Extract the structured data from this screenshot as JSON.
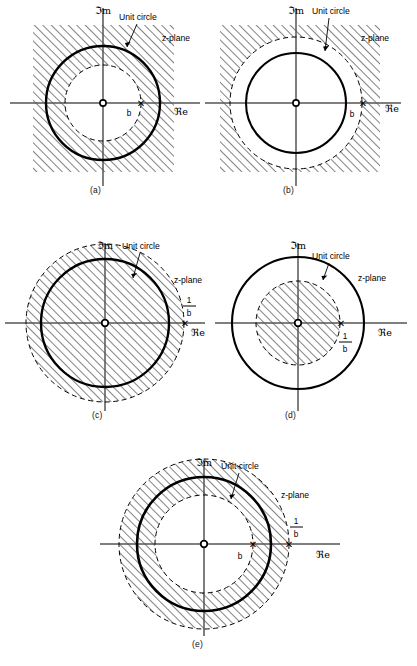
{
  "figure": {
    "panel_count": 5,
    "axis_labels": {
      "imaginary": "ℑm",
      "real": "ℜe"
    },
    "common_labels": {
      "unit_circle": "Unit circle",
      "z_plane": "z-plane",
      "pole_marker": "✕",
      "origin_marker": "o",
      "b_label": "b",
      "one_over_b_numerator": "1",
      "one_over_b_denominator": "b"
    },
    "colors": {
      "ink": "#000000",
      "background": "#ffffff",
      "hatch": "#1a1a1a",
      "axis": "#4a4a4a"
    },
    "panels": [
      {
        "id": "a",
        "caption": "(a)",
        "unit_circle_style": "solid",
        "roc_description": "hatched square region outside dashed circle of radius b",
        "circles": [
          {
            "name": "pole-circle-b",
            "radius_label": "b",
            "style": "dashed",
            "relative_radius": 0.62
          },
          {
            "name": "unit-circle",
            "radius_label": "1",
            "style": "solid-bold",
            "relative_radius": 1.0
          }
        ],
        "poles": [
          {
            "label": "b",
            "position": "inside-unit-circle"
          }
        ],
        "labels": {
          "unit_circle": "Unit circle",
          "z_plane": "z-plane",
          "pole": "b"
        }
      },
      {
        "id": "b",
        "caption": "(b)",
        "unit_circle_style": "dashed",
        "roc_description": "hatched square region outside dashed circle of radius b which is larger than the unit circle",
        "circles": [
          {
            "name": "unit-circle",
            "radius_label": "1",
            "style": "solid-bold",
            "relative_radius": 0.78
          },
          {
            "name": "pole-circle-b",
            "radius_label": "b",
            "style": "dashed",
            "relative_radius": 1.0
          }
        ],
        "poles": [
          {
            "label": "b",
            "position": "outside-unit-circle"
          }
        ],
        "labels": {
          "unit_circle": "Unit circle",
          "z_plane": "z-plane",
          "pole": "b"
        }
      },
      {
        "id": "c",
        "caption": "(c)",
        "unit_circle_style": "solid",
        "roc_description": "hatched disk inside dashed circle of radius 1/b which is larger than unit circle",
        "circles": [
          {
            "name": "unit-circle",
            "radius_label": "1",
            "style": "solid-bold",
            "relative_radius": 0.8
          },
          {
            "name": "pole-circle-inv-b",
            "radius_label": "1/b",
            "style": "dashed",
            "relative_radius": 1.0
          }
        ],
        "poles": [
          {
            "label": "1/b",
            "position": "outside-unit-circle"
          }
        ],
        "labels": {
          "unit_circle": "Unit circle",
          "z_plane": "z-plane",
          "pole_num": "1",
          "pole_den": "b"
        }
      },
      {
        "id": "d",
        "caption": "(d)",
        "unit_circle_style": "solid",
        "roc_description": "hatched disk inside dashed circle of radius 1/b which is smaller than unit circle",
        "circles": [
          {
            "name": "pole-circle-inv-b",
            "radius_label": "1/b",
            "style": "dashed",
            "relative_radius": 0.62
          },
          {
            "name": "unit-circle",
            "radius_label": "1",
            "style": "solid-bold",
            "relative_radius": 1.0
          }
        ],
        "poles": [
          {
            "label": "1/b",
            "position": "inside-unit-circle"
          }
        ],
        "labels": {
          "unit_circle": "Unit circle",
          "z_plane": "z-plane",
          "pole_num": "1",
          "pole_den": "b"
        }
      },
      {
        "id": "e",
        "caption": "(e)",
        "unit_circle_style": "solid",
        "roc_description": "hatched annulus between dashed circle of radius b and dashed circle of radius 1/b, containing the unit circle",
        "circles": [
          {
            "name": "pole-circle-b",
            "radius_label": "b",
            "style": "dashed",
            "relative_radius": 0.58
          },
          {
            "name": "unit-circle",
            "radius_label": "1",
            "style": "solid-bold",
            "relative_radius": 0.79
          },
          {
            "name": "pole-circle-inv-b",
            "radius_label": "1/b",
            "style": "dashed",
            "relative_radius": 1.0
          }
        ],
        "poles": [
          {
            "label": "b",
            "position": "inside-unit-circle"
          },
          {
            "label": "1/b",
            "position": "outside-unit-circle"
          }
        ],
        "labels": {
          "unit_circle": "Unit circle",
          "z_plane": "z-plane",
          "pole": "b",
          "pole_num": "1",
          "pole_den": "b"
        }
      }
    ]
  }
}
